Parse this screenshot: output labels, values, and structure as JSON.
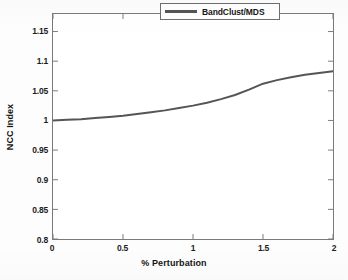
{
  "chart_data": {
    "type": "line",
    "title": "",
    "xlabel": "% Perturbation",
    "ylabel": "NCC Index",
    "xlim": [
      0,
      2
    ],
    "ylim": [
      0.8,
      1.1796
    ],
    "grid": false,
    "legend_position": "top-right",
    "xticks": [
      0,
      0.5,
      1,
      1.5,
      2
    ],
    "xticklabels": [
      "0",
      "0.5",
      "1",
      "1.5",
      "2"
    ],
    "yticks": [
      0.8,
      0.85,
      0.9,
      0.95,
      1,
      1.05,
      1.1,
      1.15
    ],
    "yticklabels": [
      "0.8",
      "0.85",
      "0.9",
      "0.95",
      "1",
      "1.05",
      "1.1",
      "1.15"
    ],
    "series": [
      {
        "name": "BandClust/MDS",
        "color": "#555555",
        "linewidth": 2,
        "x": [
          0,
          0.1,
          0.2,
          0.3,
          0.4,
          0.5,
          0.6,
          0.7,
          0.8,
          0.9,
          1,
          1.1,
          1.2,
          1.3,
          1.4,
          1.5,
          1.6,
          1.7,
          1.8,
          1.9,
          2
        ],
        "values": [
          1.0,
          1.001,
          1.002,
          1.004,
          1.006,
          1.008,
          1.011,
          1.014,
          1.017,
          1.021,
          1.025,
          1.03,
          1.036,
          1.043,
          1.052,
          1.062,
          1.068,
          1.073,
          1.077,
          1.08,
          1.083
        ]
      }
    ]
  },
  "legend": {
    "entries": [
      {
        "label": "BandClust/MDS",
        "color": "#555555"
      }
    ]
  },
  "axes": {
    "x_title": "% Perturbation",
    "y_title": "NCC Index"
  }
}
